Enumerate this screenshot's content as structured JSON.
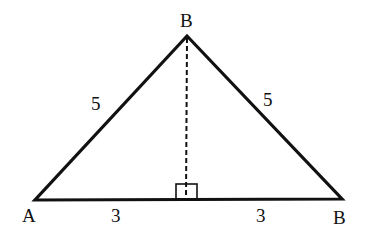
{
  "diagram": {
    "type": "isosceles-triangle",
    "vertices": {
      "apex": {
        "label": "B",
        "x": 187,
        "y": 36
      },
      "left": {
        "label": "A",
        "x": 35,
        "y": 200
      },
      "right": {
        "label": "B",
        "x": 342,
        "y": 199
      }
    },
    "side_labels": {
      "left_side": "5",
      "right_side": "5",
      "base_left": "3",
      "base_right": "3"
    },
    "altitude": {
      "style": "dashed",
      "right_angle_marker": true
    },
    "colors": {
      "stroke": "#111111",
      "background": "#ffffff"
    }
  }
}
